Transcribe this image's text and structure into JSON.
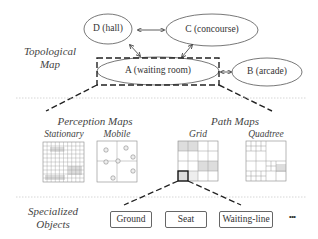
{
  "layers": {
    "topological": "Topological Map",
    "specialized": "Specialized Objects"
  },
  "nodes": [
    {
      "id": "D",
      "label": "D (hall)"
    },
    {
      "id": "C",
      "label": "C (concourse)"
    },
    {
      "id": "A",
      "label": "A (waiting room)"
    },
    {
      "id": "B",
      "label": "B (arcade)"
    }
  ],
  "edges": [
    [
      "D",
      "C"
    ],
    [
      "D",
      "A"
    ],
    [
      "C",
      "A"
    ],
    [
      "A",
      "B"
    ]
  ],
  "perception": {
    "title": "Perception Maps",
    "maps": [
      {
        "label": "Stationary"
      },
      {
        "label": "Mobile"
      }
    ]
  },
  "path": {
    "title": "Path Maps",
    "maps": [
      {
        "label": "Grid"
      },
      {
        "label": "Quadtree"
      }
    ]
  },
  "objects": [
    {
      "label": "Ground"
    },
    {
      "label": "Seat"
    },
    {
      "label": "Waiting-line"
    }
  ],
  "ellipsis": "•••"
}
